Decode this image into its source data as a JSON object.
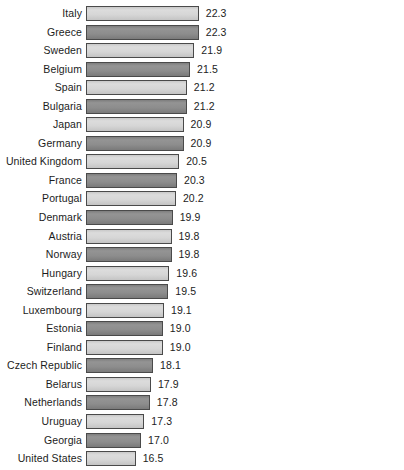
{
  "chart_data": {
    "type": "bar",
    "orientation": "horizontal",
    "title": "",
    "subtitle": "",
    "xlabel": "",
    "ylabel": "",
    "grid": false,
    "legend": null,
    "axis_visible": false,
    "tick_labels": [],
    "value_label_format": "one-decimal",
    "bar_style": {
      "alternating": true,
      "light_color": "#d6d6d6",
      "dark_color": "#8d8d8d",
      "border_color": "#4a4a4a"
    },
    "categories": [
      "Italy",
      "Greece",
      "Sweden",
      "Belgium",
      "Spain",
      "Bulgaria",
      "Japan",
      "Germany",
      "United Kingdom",
      "France",
      "Portugal",
      "Denmark",
      "Austria",
      "Norway",
      "Hungary",
      "Switzerland",
      "Luxembourg",
      "Estonia",
      "Finland",
      "Czech Republic",
      "Belarus",
      "Netherlands",
      "Uruguay",
      "Georgia",
      "United States"
    ],
    "values": [
      22.3,
      22.3,
      21.9,
      21.5,
      21.2,
      21.2,
      20.9,
      20.9,
      20.5,
      20.3,
      20.2,
      19.9,
      19.8,
      19.8,
      19.6,
      19.5,
      19.1,
      19.0,
      19.0,
      18.1,
      17.9,
      17.8,
      17.3,
      17.0,
      16.5
    ],
    "value_labels": [
      "22.3",
      "22.3",
      "21.9",
      "21.5",
      "21.2",
      "21.2",
      "20.9",
      "20.9",
      "20.5",
      "20.3",
      "20.2",
      "19.9",
      "19.8",
      "19.8",
      "19.6",
      "19.5",
      "19.1",
      "19.0",
      "19.0",
      "18.1",
      "17.9",
      "17.8",
      "17.3",
      "17.0",
      "16.5"
    ],
    "xlim": [
      12.0,
      24.0
    ]
  }
}
